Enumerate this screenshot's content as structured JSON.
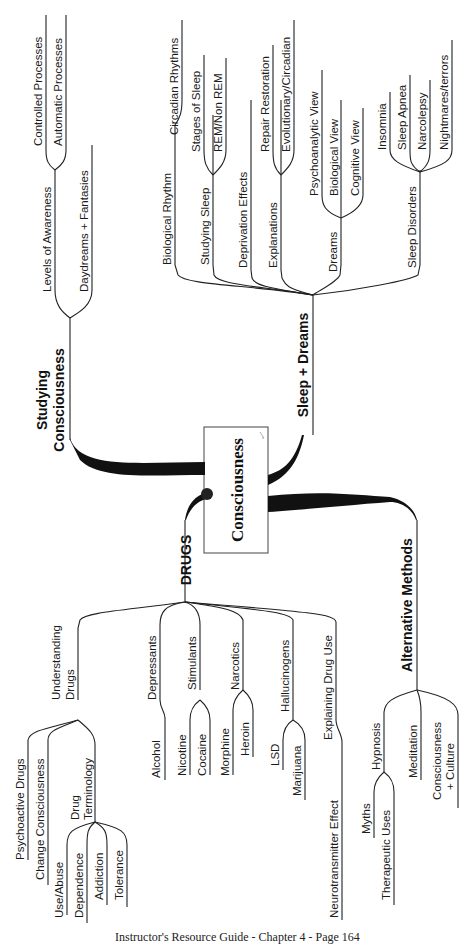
{
  "center": {
    "label": "Consciousness"
  },
  "branches": {
    "studying": {
      "label_line1": "Studying",
      "label_line2": "Consciousness",
      "levels": {
        "label": "Levels of Awareness",
        "children": [
          "Controlled Processes",
          "Automatic Processes"
        ]
      },
      "daydreams": {
        "label": "Daydreams + Fantasies"
      }
    },
    "sleep": {
      "label": "Sleep + Dreams",
      "biological_rhythm": {
        "label": "Biological Rhythm",
        "children": [
          "Circadian Rhythms"
        ]
      },
      "studying_sleep": {
        "label": "Studying Sleep",
        "children": [
          "Stages of Sleep",
          "REM/Non REM"
        ]
      },
      "deprivation": {
        "label": "Deprivation Effects"
      },
      "explanations": {
        "label": "Explanations",
        "children": [
          "Repair Restoration",
          "Evolutionary/Circadian"
        ]
      },
      "dreams": {
        "label": "Dreams",
        "children": [
          "Psychoanalytic View",
          "Biological View",
          "Cognitive View"
        ]
      },
      "disorders": {
        "label": "Sleep Disorders",
        "children": [
          "Insomnia",
          "Sleep Apnea",
          "Narcolepsy",
          "Nightmares/terrors"
        ]
      }
    },
    "drugs": {
      "label": "DRUGS",
      "understanding": {
        "label_line1": "Understanding",
        "label_line2": "Drugs",
        "children": [
          "Psychoactive Drugs",
          "Change Consciousness"
        ],
        "terminology": {
          "label_line1": "Drug",
          "label_line2": "Terminology",
          "children": [
            "Use/Abuse",
            "Dependence",
            "Addiction",
            "Tolerance"
          ]
        }
      },
      "depressants": {
        "label": "Depressants",
        "children": [
          "Alcohol"
        ]
      },
      "stimulants": {
        "label": "Stimulants",
        "children": [
          "Nicotine",
          "Cocaine"
        ]
      },
      "narcotics": {
        "label": "Narcotics",
        "children": [
          "Morphine",
          "Heroin"
        ]
      },
      "hallucinogens": {
        "label": "Hallucinogens",
        "children": [
          "LSD",
          "Marijuana"
        ]
      },
      "explaining": {
        "label": "Explaining Drug Use",
        "children": [
          "Neurotransmitter Effect"
        ]
      }
    },
    "alternative": {
      "label": "Alternative Methods",
      "hypnosis": {
        "label": "Hypnosis",
        "children": [
          "Myths",
          "Therapeutic Uses"
        ]
      },
      "meditation": {
        "label": "Meditation"
      },
      "culture": {
        "label_line1": "Consciousness",
        "label_line2": "+ Culture"
      }
    }
  },
  "footer": {
    "text": "Instructor's Resource Guide - Chapter 4 - Page 164"
  }
}
